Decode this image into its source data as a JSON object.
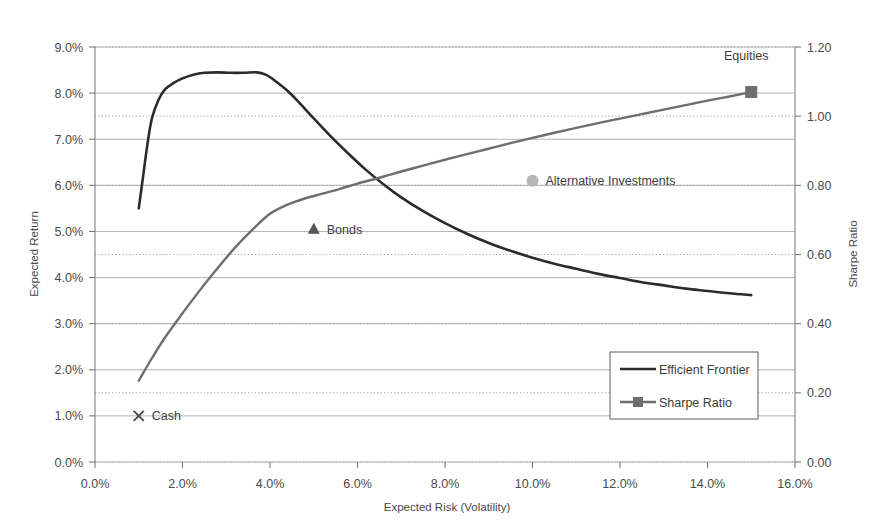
{
  "chart_data": {
    "type": "line",
    "title": "",
    "xlabel": "Expected Risk (Volatility)",
    "ylabel": "Expected Return",
    "y2label": "Sharpe Ratio",
    "xlim": [
      0,
      16
    ],
    "ylim": [
      0,
      9
    ],
    "y2lim": [
      0,
      1.2
    ],
    "grid": true,
    "legend_position": "inside-right-lower",
    "x_tick_labels": [
      "0.0%",
      "2.0%",
      "4.0%",
      "6.0%",
      "8.0%",
      "10.0%",
      "12.0%",
      "14.0%",
      "16.0%"
    ],
    "x_tick_values": [
      0,
      2,
      4,
      6,
      8,
      10,
      12,
      14,
      16
    ],
    "y_tick_labels": [
      "0.0%",
      "1.0%",
      "2.0%",
      "3.0%",
      "4.0%",
      "5.0%",
      "6.0%",
      "7.0%",
      "8.0%",
      "9.0%"
    ],
    "y_tick_values": [
      0,
      1,
      2,
      3,
      4,
      5,
      6,
      7,
      8,
      9
    ],
    "y2_tick_labels": [
      "0.00",
      "0.20",
      "0.40",
      "0.60",
      "0.80",
      "1.00",
      "1.20"
    ],
    "y2_tick_values": [
      0,
      0.2,
      0.4,
      0.6,
      0.8,
      1.0,
      1.2
    ],
    "series": [
      {
        "name": "Efficient Frontier",
        "axis": "left",
        "color": "#2b2b2b",
        "width": 2.6,
        "marker": "none",
        "points": [
          [
            1.0,
            5.5
          ],
          [
            1.1,
            6.2
          ],
          [
            1.2,
            6.9
          ],
          [
            1.3,
            7.45
          ],
          [
            1.45,
            7.85
          ],
          [
            1.6,
            8.08
          ],
          [
            1.8,
            8.22
          ],
          [
            2.0,
            8.32
          ],
          [
            2.25,
            8.4
          ],
          [
            2.5,
            8.44
          ],
          [
            2.8,
            8.45
          ],
          [
            3.1,
            8.44
          ],
          [
            3.4,
            8.44
          ],
          [
            3.7,
            8.45
          ],
          [
            3.9,
            8.4
          ],
          [
            4.1,
            8.28
          ],
          [
            4.4,
            8.05
          ],
          [
            4.7,
            7.76
          ],
          [
            5.0,
            7.45
          ],
          [
            5.4,
            7.05
          ],
          [
            5.8,
            6.68
          ],
          [
            6.2,
            6.33
          ],
          [
            6.6,
            6.02
          ],
          [
            7.0,
            5.74
          ],
          [
            7.5,
            5.44
          ],
          [
            8.0,
            5.18
          ],
          [
            8.5,
            4.95
          ],
          [
            9.0,
            4.75
          ],
          [
            9.5,
            4.58
          ],
          [
            10.0,
            4.43
          ],
          [
            10.5,
            4.3
          ],
          [
            11.0,
            4.19
          ],
          [
            11.5,
            4.08
          ],
          [
            12.0,
            3.99
          ],
          [
            12.5,
            3.9
          ],
          [
            13.0,
            3.83
          ],
          [
            13.5,
            3.76
          ],
          [
            14.0,
            3.71
          ],
          [
            14.5,
            3.66
          ],
          [
            15.0,
            3.62
          ]
        ]
      },
      {
        "name": "Sharpe Ratio",
        "axis": "right",
        "color": "#6e6e6e",
        "width": 2.4,
        "marker": "square",
        "points": [
          [
            1.0,
            0.235
          ],
          [
            1.3,
            0.3
          ],
          [
            1.6,
            0.36
          ],
          [
            2.0,
            0.43
          ],
          [
            2.4,
            0.497
          ],
          [
            2.8,
            0.56
          ],
          [
            3.2,
            0.62
          ],
          [
            3.6,
            0.672
          ],
          [
            4.0,
            0.718
          ],
          [
            4.4,
            0.744
          ],
          [
            4.8,
            0.762
          ],
          [
            5.2,
            0.776
          ],
          [
            5.6,
            0.79
          ],
          [
            6.0,
            0.805
          ],
          [
            6.5,
            0.822
          ],
          [
            7.0,
            0.84
          ],
          [
            7.5,
            0.857
          ],
          [
            8.0,
            0.874
          ],
          [
            8.5,
            0.89
          ],
          [
            9.0,
            0.906
          ],
          [
            9.5,
            0.922
          ],
          [
            10.0,
            0.937
          ],
          [
            10.5,
            0.952
          ],
          [
            11.0,
            0.966
          ],
          [
            11.5,
            0.98
          ],
          [
            12.0,
            0.993
          ],
          [
            12.5,
            1.006
          ],
          [
            13.0,
            1.019
          ],
          [
            13.5,
            1.032
          ],
          [
            14.0,
            1.045
          ],
          [
            14.5,
            1.057
          ],
          [
            15.0,
            1.07
          ]
        ]
      }
    ],
    "annotations": [
      {
        "label": "Cash",
        "marker": "cross",
        "x": 1.0,
        "y": 1.0,
        "axis": "left",
        "color": "#4a4a4a"
      },
      {
        "label": "Bonds",
        "marker": "triangle",
        "x": 5.0,
        "y": 5.05,
        "axis": "left",
        "color": "#555555"
      },
      {
        "label": "Alternative Investments",
        "marker": "circle",
        "x": 10.0,
        "y": 6.1,
        "axis": "left",
        "color": "#b6b6b6"
      },
      {
        "label": "Equities",
        "marker": "none",
        "x": 15.0,
        "y": 1.105,
        "axis": "right",
        "color": "#3d3d3d"
      }
    ],
    "legend": [
      {
        "label": "Efficient Frontier",
        "marker": "line",
        "color": "#2b2b2b"
      },
      {
        "label": "Sharpe Ratio",
        "marker": "line-square",
        "color": "#6e6e6e"
      }
    ]
  }
}
